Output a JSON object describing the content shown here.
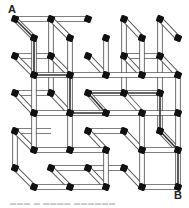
{
  "diagram": {
    "type": "3d-lattice-maze",
    "start_label": "A",
    "end_label": "B",
    "caption": "▬▬▬ ▬ ▬▬▬▬ ▬▬▬▬▬▬",
    "colors": {
      "node": "#111111",
      "tube_fill": "#ffffff",
      "tube_edge": "#555555",
      "path": "#333333",
      "background": "#ffffff"
    },
    "grid": {
      "back_x": [
        15,
        51,
        88,
        124,
        160
      ],
      "back_y": [
        19,
        56,
        93,
        131,
        168
      ],
      "front_x": [
        34,
        70,
        106,
        142,
        178
      ],
      "front_y": [
        38,
        75,
        113,
        150,
        187
      ]
    },
    "back_nodes": [
      [
        0,
        0
      ],
      [
        1,
        0
      ],
      [
        2,
        0
      ],
      [
        3,
        0
      ],
      [
        4,
        0
      ],
      [
        0,
        1
      ],
      [
        1,
        1
      ],
      [
        2,
        1
      ],
      [
        3,
        1
      ],
      [
        4,
        1
      ],
      [
        0,
        2
      ],
      [
        1,
        2
      ],
      [
        2,
        2
      ],
      [
        3,
        2
      ],
      [
        4,
        2
      ],
      [
        0,
        3
      ],
      [
        2,
        3
      ],
      [
        3,
        3
      ],
      [
        4,
        3
      ],
      [
        0,
        4
      ],
      [
        1,
        4
      ],
      [
        2,
        4
      ],
      [
        3,
        4
      ]
    ],
    "front_nodes": [
      [
        0,
        0
      ],
      [
        1,
        0
      ],
      [
        2,
        0
      ],
      [
        3,
        0
      ],
      [
        4,
        0
      ],
      [
        0,
        1
      ],
      [
        1,
        1
      ],
      [
        2,
        1
      ],
      [
        3,
        1
      ],
      [
        4,
        1
      ],
      [
        0,
        2
      ],
      [
        1,
        2
      ],
      [
        2,
        2
      ],
      [
        3,
        2
      ],
      [
        4,
        2
      ],
      [
        0,
        3
      ],
      [
        1,
        3
      ],
      [
        2,
        3
      ],
      [
        3,
        3
      ],
      [
        4,
        3
      ],
      [
        0,
        4
      ],
      [
        1,
        4
      ],
      [
        2,
        4
      ],
      [
        3,
        4
      ],
      [
        4,
        4
      ]
    ],
    "back_h_edges": [
      [
        0,
        0,
        1,
        0
      ],
      [
        1,
        0,
        2,
        0
      ],
      [
        0,
        1,
        1,
        1
      ],
      [
        2,
        2,
        3,
        2
      ],
      [
        3,
        2,
        4,
        2
      ],
      [
        0,
        3,
        1,
        3
      ],
      [
        1,
        4,
        2,
        4
      ],
      [
        2,
        4,
        3,
        4
      ],
      [
        3,
        1,
        4,
        1
      ],
      [
        2,
        3,
        3,
        3
      ],
      [
        0,
        2,
        1,
        2
      ]
    ],
    "back_v_edges": [
      [
        1,
        0,
        1,
        1
      ],
      [
        1,
        1,
        1,
        2
      ],
      [
        3,
        0,
        3,
        1
      ],
      [
        4,
        0,
        4,
        1
      ],
      [
        4,
        1,
        4,
        2
      ],
      [
        4,
        2,
        4,
        3
      ],
      [
        0,
        3,
        0,
        4
      ],
      [
        3,
        1,
        3,
        2
      ]
    ],
    "front_h_edges": [
      [
        0,
        1,
        1,
        1
      ],
      [
        1,
        1,
        2,
        1
      ],
      [
        2,
        1,
        3,
        1
      ],
      [
        0,
        2,
        1,
        2
      ],
      [
        1,
        2,
        2,
        2
      ],
      [
        2,
        2,
        3,
        2
      ],
      [
        3,
        2,
        4,
        2
      ],
      [
        0,
        3,
        1,
        3
      ],
      [
        1,
        3,
        2,
        3
      ],
      [
        3,
        3,
        4,
        3
      ],
      [
        0,
        4,
        1,
        4
      ],
      [
        1,
        4,
        2,
        4
      ],
      [
        3,
        4,
        4,
        4
      ],
      [
        3,
        1,
        4,
        1
      ]
    ],
    "front_v_edges": [
      [
        0,
        0,
        0,
        1
      ],
      [
        0,
        1,
        0,
        2
      ],
      [
        0,
        2,
        0,
        3
      ],
      [
        1,
        0,
        1,
        1
      ],
      [
        1,
        1,
        1,
        2
      ],
      [
        1,
        2,
        1,
        3
      ],
      [
        2,
        0,
        2,
        1
      ],
      [
        2,
        3,
        2,
        4
      ],
      [
        3,
        2,
        3,
        3
      ],
      [
        3,
        3,
        3,
        4
      ],
      [
        4,
        1,
        4,
        2
      ],
      [
        4,
        2,
        4,
        3
      ],
      [
        4,
        3,
        4,
        4
      ],
      [
        3,
        0,
        3,
        1
      ]
    ],
    "depth_edges": [
      [
        0,
        0
      ],
      [
        1,
        0
      ],
      [
        3,
        0
      ],
      [
        4,
        0
      ],
      [
        0,
        1
      ],
      [
        1,
        1
      ],
      [
        2,
        1
      ],
      [
        3,
        1
      ],
      [
        4,
        1
      ],
      [
        0,
        2
      ],
      [
        1,
        2
      ],
      [
        2,
        2
      ],
      [
        3,
        2
      ],
      [
        4,
        3
      ],
      [
        0,
        3
      ],
      [
        2,
        3
      ],
      [
        3,
        3
      ],
      [
        1,
        4
      ],
      [
        2,
        4
      ],
      [
        3,
        4
      ],
      [
        0,
        4
      ]
    ],
    "solution_path": [
      [
        15,
        19
      ],
      [
        34,
        38
      ],
      [
        34,
        75
      ],
      [
        70,
        75
      ],
      [
        70,
        113
      ],
      [
        106,
        113
      ],
      [
        88,
        93
      ],
      [
        160,
        93
      ],
      [
        160,
        131
      ],
      [
        178,
        150
      ],
      [
        178,
        187
      ]
    ]
  }
}
